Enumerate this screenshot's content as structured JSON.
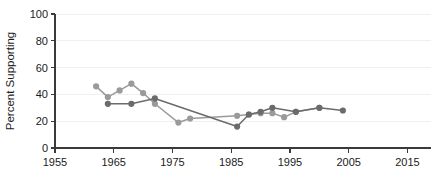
{
  "chart_data": {
    "type": "line",
    "title": "",
    "xlabel": "",
    "ylabel": "Percent Supporting",
    "xlim": [
      1955,
      2019
    ],
    "ylim": [
      0,
      100
    ],
    "xticks": [
      1955,
      1965,
      1975,
      1985,
      1995,
      2005,
      2015
    ],
    "yticks": [
      0,
      20,
      40,
      60,
      80,
      100
    ],
    "grid": "horizontal",
    "legend": "none",
    "series": [
      {
        "name": "light-gray-series",
        "color": "#9a9a9a",
        "marker": "circle",
        "points": [
          {
            "x": 1962,
            "y": 46
          },
          {
            "x": 1964,
            "y": 38
          },
          {
            "x": 1966,
            "y": 43
          },
          {
            "x": 1968,
            "y": 48
          },
          {
            "x": 1970,
            "y": 41
          },
          {
            "x": 1972,
            "y": 33
          },
          {
            "x": 1976,
            "y": 19
          },
          {
            "x": 1978,
            "y": 22
          },
          {
            "x": 1986,
            "y": 24
          },
          {
            "x": 1988,
            "y": 25
          },
          {
            "x": 1990,
            "y": 26
          },
          {
            "x": 1992,
            "y": 26
          },
          {
            "x": 1994,
            "y": 23
          },
          {
            "x": 1996,
            "y": 27
          },
          {
            "x": 2000,
            "y": 30
          }
        ]
      },
      {
        "name": "dark-gray-series",
        "color": "#6b6b6b",
        "marker": "circle",
        "points": [
          {
            "x": 1964,
            "y": 33
          },
          {
            "x": 1968,
            "y": 33
          },
          {
            "x": 1972,
            "y": 37
          },
          {
            "x": 1986,
            "y": 16
          },
          {
            "x": 1988,
            "y": 25
          },
          {
            "x": 1990,
            "y": 27
          },
          {
            "x": 1992,
            "y": 30
          },
          {
            "x": 1996,
            "y": 27
          },
          {
            "x": 2000,
            "y": 30
          },
          {
            "x": 2004,
            "y": 28
          }
        ]
      }
    ]
  }
}
